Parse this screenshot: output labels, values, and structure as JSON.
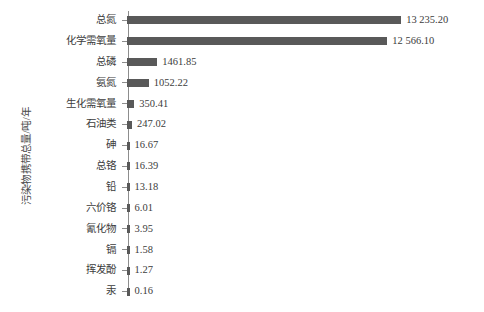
{
  "chart_data": {
    "type": "bar",
    "orientation": "horizontal",
    "title": "",
    "subtitle": "",
    "xlabel": "",
    "ylabel": "污染物携带总量/吨/年",
    "grid": false,
    "legend": null,
    "xlim": [
      0,
      14000
    ],
    "categories": [
      "总氮",
      "化学需氧量",
      "总磷",
      "氨氮",
      "生化需氧量",
      "石油类",
      "砷",
      "总铬",
      "铅",
      "六价铬",
      "氰化物",
      "镉",
      "挥发酚",
      "汞"
    ],
    "values": [
      13235.2,
      12566.1,
      1461.85,
      1052.22,
      350.41,
      247.02,
      16.67,
      16.39,
      13.18,
      6.01,
      3.95,
      1.58,
      1.27,
      0.16
    ],
    "value_labels": [
      "13 235.20",
      "12 566.10",
      "1461.85",
      "1052.22",
      "350.41",
      "247.02",
      "16.67",
      "16.39",
      "13.18",
      "6.01",
      "3.95",
      "1.58",
      "1.27",
      "0.16"
    ],
    "bar_color": "#595959",
    "axis_color": "#8d8d8d",
    "text_color": "#3c3c3c",
    "background": "#ffffff"
  }
}
